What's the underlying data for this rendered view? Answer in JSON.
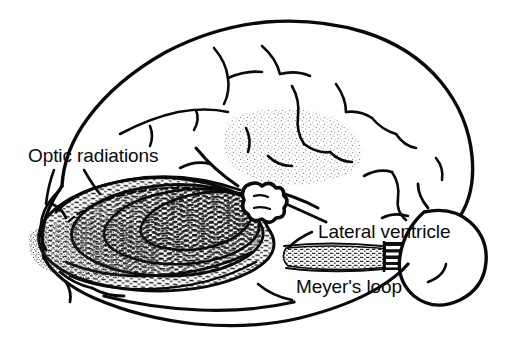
{
  "figure": {
    "background_color": "#ffffff",
    "ink_color": "#0a0a0a",
    "stipple_color": "#8c8c8c",
    "style": "black-and-white anatomical line drawing with stipple and hatch shading"
  },
  "labels": {
    "optic_radiations": "Optic radiations",
    "lateral_ventricle": "Lateral ventricle",
    "meyers_loop": "Meyer's loop"
  },
  "structures": {
    "cerebral_hemisphere": "cerebral-hemisphere-outline",
    "sulci": "cortical-sulci",
    "occipital_stipple": "occipital-stipple-shading",
    "parietal_stipple": "parietal-stipple-shading",
    "optic_radiation_bundles": "optic-radiation-fiber-bundles",
    "lateral_geniculate_nucleus": "lateral-geniculate-nucleus",
    "ventricle_band": "lateral-ventricle-hatched-band",
    "temporal_horn_block": "temporal-horn-striped-block",
    "temporal_pole": "temporal-pole-lobe",
    "leader_lines": "label-leader-lines"
  }
}
